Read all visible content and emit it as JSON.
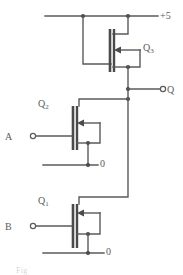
{
  "figure": {
    "caption_fragment": "Fig"
  },
  "labels": {
    "supply": "+5",
    "output": "Q",
    "input_a": "A",
    "input_b": "B",
    "ground_upper": "0",
    "ground_lower": "0",
    "q3_name": "Q",
    "q3_sub": "3",
    "q2_name": "Q",
    "q2_sub": "2",
    "q1_name": "Q",
    "q1_sub": "1"
  },
  "terminals": [
    {
      "name": "supply-terminal",
      "label": "+5",
      "type": "rail"
    },
    {
      "name": "output-terminal",
      "label": "Q",
      "type": "open-circle"
    },
    {
      "name": "input-a-terminal",
      "label": "A",
      "type": "open-circle"
    },
    {
      "name": "input-b-terminal",
      "label": "B",
      "type": "open-circle"
    },
    {
      "name": "ground-upper-terminal",
      "label": "0",
      "type": "rail"
    },
    {
      "name": "ground-lower-terminal",
      "label": "0",
      "type": "rail"
    }
  ],
  "devices": [
    {
      "name": "Q3",
      "type": "n-channel MOSFET",
      "role": "load / pull-up",
      "gate_connection": "source (depletion load)"
    },
    {
      "name": "Q2",
      "type": "n-channel MOSFET",
      "role": "driver",
      "gate_connection": "A"
    },
    {
      "name": "Q1",
      "type": "n-channel MOSFET",
      "role": "driver",
      "gate_connection": "B"
    }
  ],
  "colors": {
    "wire": "#5a5a5a",
    "device": "#4a4a4a",
    "text": "#5b5b5b",
    "background": "#ffffff"
  }
}
